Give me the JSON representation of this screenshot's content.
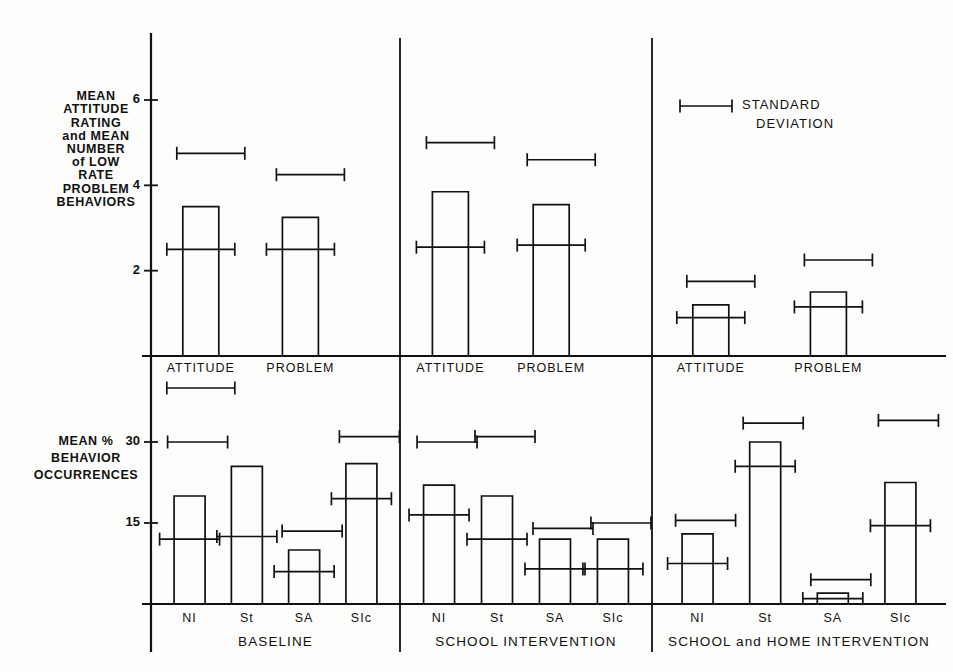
{
  "figure": {
    "background_color": "#fdfdfb",
    "ink_color": "#111111"
  },
  "legend": {
    "marker": "error-bar-marker",
    "line1": "STANDARD",
    "line2": "DEVIATION"
  },
  "upper_axis": {
    "label_lines": [
      "MEAN",
      "ATTITUDE",
      "RATING",
      "and MEAN",
      "NUMBER",
      "of LOW",
      "RATE",
      "PROBLEM",
      "BEHAVIORS"
    ],
    "ticks": [
      "2",
      "4",
      "6"
    ],
    "tick_values": [
      2,
      4,
      6
    ],
    "ylim": [
      0,
      6.9
    ]
  },
  "lower_axis": {
    "label_lines": [
      "MEAN %",
      "BEHAVIOR",
      "OCCURRENCES"
    ],
    "ticks": [
      "15",
      "30"
    ],
    "tick_values": [
      15,
      30
    ],
    "ylim": [
      0,
      36
    ]
  },
  "panels": [
    {
      "name": "BASELINE"
    },
    {
      "name": "SCHOOL INTERVENTION"
    },
    {
      "name": "SCHOOL and HOME INTERVENTION"
    }
  ],
  "upper_category_labels": [
    "ATTITUDE",
    "PROBLEM"
  ],
  "lower_category_labels": [
    "NI",
    "St",
    "SA",
    "SIc"
  ],
  "chart_data": {
    "type": "bar",
    "title": "",
    "xlabel": "",
    "ylabel": "MEAN ATTITUDE RATING and MEAN NUMBER of LOW RATE PROBLEM BEHAVIORS / MEAN % BEHAVIOR OCCURRENCES",
    "legend": "STANDARD DEVIATION",
    "legend_position": "top-right",
    "grid": false,
    "panels": [
      "BASELINE",
      "SCHOOL INTERVENTION",
      "SCHOOL and HOME INTERVENTION"
    ],
    "subplots": [
      {
        "id": "upper",
        "type": "bar",
        "ylabel": "MEAN ATTITUDE RATING and MEAN NUMBER of LOW RATE PROBLEM BEHAVIORS",
        "ylim": [
          0,
          6.9
        ],
        "yticks": [
          2,
          4,
          6
        ],
        "categories": [
          "ATTITUDE",
          "PROBLEM"
        ],
        "groups": [
          {
            "panel": "BASELINE",
            "values": [
              3.5,
              3.25
            ],
            "error_bar_centers": [
              2.5,
              2.5
            ],
            "error_bar_spans": [
              [
                2.5,
                2.5
              ],
              [
                2.5,
                2.5
              ]
            ],
            "sd_bars_above": [
              4.75,
              4.25
            ],
            "sd_bar_below_axis": true
          },
          {
            "panel": "SCHOOL INTERVENTION",
            "values": [
              3.85,
              3.55
            ],
            "error_bar_centers": [
              2.55,
              2.6
            ],
            "sd_bars_above": [
              5.0,
              4.6
            ]
          },
          {
            "panel": "SCHOOL and HOME INTERVENTION",
            "values": [
              1.2,
              1.5
            ],
            "error_bar_centers": [
              0.9,
              1.15
            ],
            "sd_bars_above": [
              1.75,
              2.25
            ]
          }
        ]
      },
      {
        "id": "lower",
        "type": "bar",
        "ylabel": "MEAN % BEHAVIOR OCCURRENCES",
        "ylim": [
          0,
          36
        ],
        "yticks": [
          15,
          30
        ],
        "categories": [
          "NI",
          "St",
          "SA",
          "SIc"
        ],
        "groups": [
          {
            "panel": "BASELINE",
            "values": [
              20.0,
              25.5,
              10.0,
              26.0
            ],
            "error_bar_centers": [
              12.0,
              12.5,
              6.0,
              19.5
            ],
            "sd_bars_above": [
              30.0,
              null,
              13.5,
              31.0
            ]
          },
          {
            "panel": "SCHOOL INTERVENTION",
            "values": [
              22.0,
              20.0,
              12.0,
              12.0
            ],
            "error_bar_centers": [
              16.5,
              12.0,
              6.5,
              6.5
            ],
            "sd_bars_above": [
              30.0,
              31.0,
              14.0,
              15.0
            ]
          },
          {
            "panel": "SCHOOL and HOME INTERVENTION",
            "values": [
              13.0,
              30.0,
              2.0,
              22.5
            ],
            "error_bar_centers": [
              7.5,
              25.5,
              1.0,
              14.5
            ],
            "sd_bars_above": [
              15.5,
              33.5,
              4.5,
              34.0
            ]
          }
        ]
      }
    ]
  }
}
